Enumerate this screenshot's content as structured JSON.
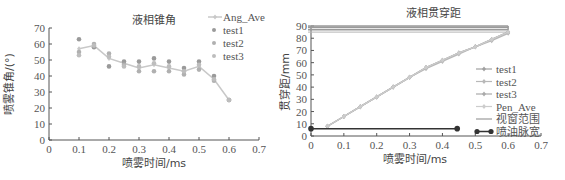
{
  "chart_data": [
    {
      "type": "line",
      "title": "液相锥角",
      "xlabel": "喷雾时间/ms",
      "ylabel": "喷雾锥角/(°)",
      "xlim": [
        0,
        0.7
      ],
      "ylim": [
        0,
        70
      ],
      "xticks": [
        "0",
        "0.1",
        "0.2",
        "0.3",
        "0.4",
        "0.5",
        "0.6",
        "0.7"
      ],
      "yticks": [
        "0",
        "10",
        "20",
        "30",
        "40",
        "50",
        "60",
        "70"
      ],
      "grid": false,
      "legend_position": "upper right",
      "x": [
        0.1,
        0.15,
        0.2,
        0.25,
        0.3,
        0.35,
        0.4,
        0.45,
        0.5,
        0.55,
        0.6
      ],
      "series": [
        {
          "name": "Ang_Ave",
          "style": "line-marker",
          "color": "#c8c8c8",
          "values": [
            57,
            59,
            51,
            48,
            45,
            47,
            45,
            43,
            46,
            38,
            25
          ]
        },
        {
          "name": "test1",
          "style": "marker",
          "color": "#9a9a9a",
          "values": [
            63,
            58,
            46,
            49,
            49,
            51,
            49,
            45,
            49,
            40,
            25
          ]
        },
        {
          "name": "test2",
          "style": "marker",
          "color": "#b0b0b0",
          "values": [
            55,
            60,
            54,
            47,
            43,
            43,
            43,
            41,
            44,
            37,
            25
          ]
        },
        {
          "name": "test3",
          "style": "marker",
          "color": "#bdbdbd",
          "values": [
            53,
            59,
            52,
            46,
            46,
            48,
            46,
            43,
            47,
            38,
            25
          ]
        }
      ]
    },
    {
      "type": "line",
      "title": "液相贯穿距",
      "xlabel": "喷雾时间/ms",
      "ylabel": "贯穿距/mm",
      "xlim": [
        0,
        0.7
      ],
      "ylim": [
        0,
        90
      ],
      "xticks": [
        "0",
        "0.1",
        "0.2",
        "0.3",
        "0.4",
        "0.5",
        "0.6",
        "0.7"
      ],
      "yticks": [
        "0",
        "10",
        "20",
        "30",
        "40",
        "50",
        "60",
        "70",
        "80",
        "90"
      ],
      "grid": false,
      "legend_position": "center right",
      "x": [
        0.05,
        0.1,
        0.15,
        0.2,
        0.25,
        0.3,
        0.35,
        0.4,
        0.45,
        0.5,
        0.55,
        0.6
      ],
      "series": [
        {
          "name": "test1",
          "style": "line-marker",
          "color": "#a0a0a0",
          "values": [
            8,
            16,
            24,
            32,
            40,
            48,
            56,
            62,
            68,
            73,
            79,
            85
          ]
        },
        {
          "name": "test2",
          "style": "line-marker",
          "color": "#b8b8b8",
          "values": [
            8,
            16,
            24,
            32,
            40,
            48,
            55,
            61,
            67,
            73,
            78,
            84
          ]
        },
        {
          "name": "test3",
          "style": "line-marker",
          "color": "#aaaaaa",
          "values": [
            8,
            16,
            24,
            32,
            40,
            48,
            56,
            62,
            68,
            73,
            79,
            85
          ]
        },
        {
          "name": "Pen_Ave",
          "style": "line-marker",
          "color": "#cccccc",
          "values": [
            8,
            16,
            24,
            32,
            40,
            48,
            56,
            62,
            68,
            73,
            79,
            85
          ]
        }
      ],
      "reference_lines": [
        {
          "name": "视窗范围",
          "type": "horizontal-band",
          "color": "#9a9a9a",
          "y_values": [
            85,
            87,
            89,
            90
          ],
          "x_range": [
            0,
            0.6
          ]
        },
        {
          "name": "喷油脉宽",
          "type": "segment",
          "color": "#333333",
          "x_range": [
            0,
            0.445
          ],
          "y": 6
        }
      ]
    }
  ],
  "left_chart": {
    "title": "液相锥角",
    "xlabel": "喷雾时间/ms",
    "ylabel": "喷雾锥角/(°)",
    "legend": [
      "Ang_Ave",
      "test1",
      "test2",
      "test3"
    ]
  },
  "right_chart": {
    "title": "液相贯穿距",
    "xlabel": "喷雾时间/ms",
    "ylabel": "贯穿距/mm",
    "legend": [
      "test1",
      "test2",
      "test3",
      "Pen_Ave",
      "视窗范围",
      "喷油脉宽"
    ]
  }
}
